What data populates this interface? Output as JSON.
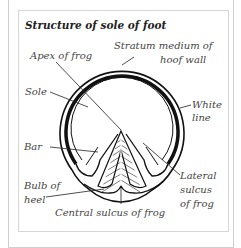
{
  "title": "Structure of sole of foot",
  "labels": {
    "apex": "Apex of frog",
    "stratum_1": "Stratum medium of",
    "stratum_2": "hoof wall",
    "sole": "Sole",
    "white_1": "White",
    "white_2": "line",
    "bar": "Bar",
    "bulb_1": "Bulb of",
    "bulb_2": "heel",
    "lateral_1": "Lateral",
    "lateral_2": "sulcus",
    "lateral_3": "of frog",
    "central": "Central sulcus of frog"
  },
  "colors": {
    "line": "#111111",
    "text": "#444444",
    "frame": "#d0d0d0"
  }
}
